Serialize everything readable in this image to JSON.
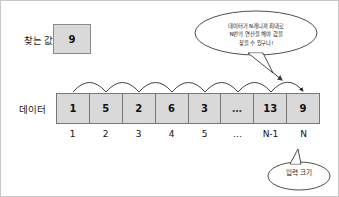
{
  "diagram": {
    "title_labels": {
      "search_value": "찾는 값",
      "data": "데이터"
    },
    "search_value": "9",
    "array": {
      "cells": [
        "1",
        "5",
        "2",
        "6",
        "3",
        "…",
        "13",
        "9"
      ],
      "indices": [
        "1",
        "2",
        "3",
        "4",
        "5",
        "…",
        "N-1",
        "N"
      ]
    },
    "top_bubble": {
      "line1": "데이터가 N개니까 최대로",
      "line2": "N번의 연산을 해야 값을",
      "line3": "찾을 수 있구나!"
    },
    "bottom_bubble": {
      "line1": "입력 크기"
    },
    "colors": {
      "cell_fill": "#d9d9d9",
      "cell_border": "#777777",
      "stroke": "#3a3a3a",
      "background": "#ffffff"
    },
    "arrow_hops": 7
  }
}
